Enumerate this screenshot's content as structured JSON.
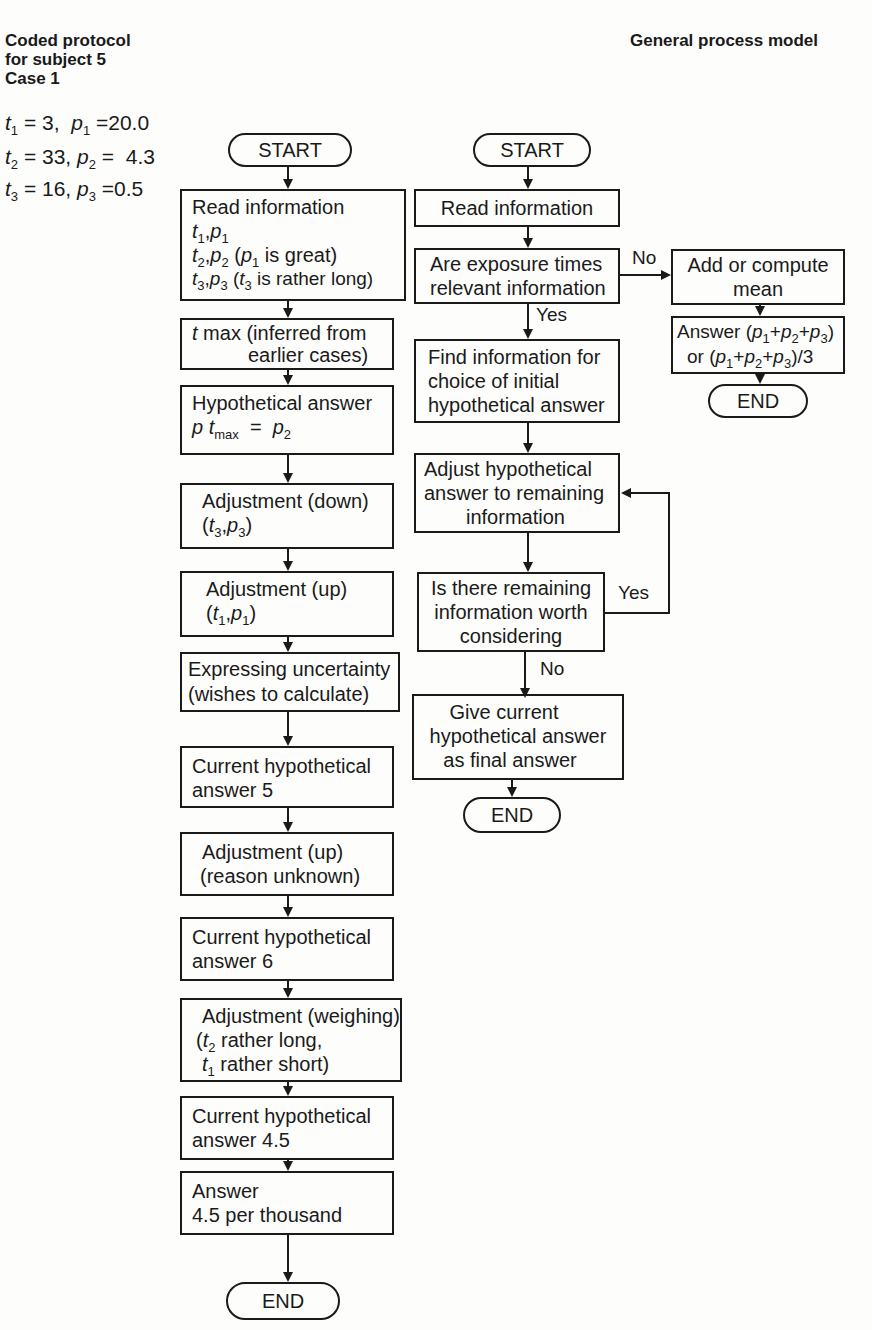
{
  "header": {
    "left_title_lines": [
      "Coded protocol",
      "for subject 5",
      "Case 1"
    ],
    "right_title": "General process model"
  },
  "given_values": [
    {
      "t_label": "t",
      "t_sub": "1",
      "t_val": "= 3,",
      "p_label": "p",
      "p_sub": "1",
      "p_val": "=20.0"
    },
    {
      "t_label": "t",
      "t_sub": "2",
      "t_val": "= 33,",
      "p_label": "p",
      "p_sub": "2",
      "p_val": "=  4.3"
    },
    {
      "t_label": "t",
      "t_sub": "3",
      "t_val": "= 16,",
      "p_label": "p",
      "p_sub": "3",
      "p_val": "=0.5"
    }
  ],
  "protocol_flow": {
    "start": "START",
    "steps": [
      {
        "line1": "Read information",
        "line2": "t1, p1",
        "line3": "t2, p2 (p1 is great)",
        "line4": "t3, p3 (t3 is rather long)"
      },
      {
        "line1": "t max (inferred from",
        "line2": "earlier cases)"
      },
      {
        "line1": "Hypothetical answer",
        "line2": "p t_max = p2"
      },
      {
        "line1": "Adjustment (down)",
        "line2": "(t3, p3)"
      },
      {
        "line1": "Adjustment (up)",
        "line2": "(t1, p1)"
      },
      {
        "line1": "Expressing uncertainty",
        "line2": "(wishes to calculate)"
      },
      {
        "line1": "Current hypothetical",
        "line2": "answer 5"
      },
      {
        "line1": "Adjustment (up)",
        "line2": "(reason unknown)"
      },
      {
        "line1": "Current hypothetical",
        "line2": "answer 6"
      },
      {
        "line1": "Adjustment (weighing)",
        "line2": "(t2 rather long,",
        "line3": "t1 rather short)"
      },
      {
        "line1": "Current hypothetical",
        "line2": "answer 4.5"
      },
      {
        "line1": "Answer",
        "line2": "4.5 per thousand"
      }
    ],
    "end": "END"
  },
  "general_model": {
    "start": "START",
    "read": "Read information",
    "decision1": {
      "line1": "Are exposure times",
      "line2": "relevant information",
      "no_label": "No",
      "yes_label": "Yes"
    },
    "find": {
      "line1": "Find information for",
      "line2": "choice of initial",
      "line3": "hypothetical answer"
    },
    "adjust": {
      "line1": "Adjust hypothetical",
      "line2": "answer to remaining",
      "line3": "information"
    },
    "decision2": {
      "line1": "Is there remaining",
      "line2": "information worth",
      "line3": "considering",
      "yes_label": "Yes",
      "no_label": "No"
    },
    "give": {
      "line1": "Give current",
      "line2": "hypothetical answer",
      "line3": "as final answer"
    },
    "end": "END",
    "no_branch": {
      "add": {
        "line1": "Add or compute",
        "line2": "mean"
      },
      "answer": {
        "line1": "Answer (p1+p2+p3)",
        "line2": "or (p1+p2+p3)/3"
      },
      "end": "END"
    }
  }
}
